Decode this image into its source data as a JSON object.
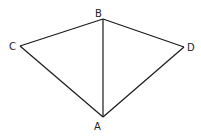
{
  "diagram": {
    "points": {
      "A": {
        "label": "A",
        "x": 103,
        "y": 117
      },
      "B": {
        "label": "B",
        "x": 103,
        "y": 19
      },
      "C": {
        "label": "C",
        "x": 20,
        "y": 46
      },
      "D": {
        "label": "D",
        "x": 184,
        "y": 47
      }
    },
    "edges": [
      [
        "C",
        "B"
      ],
      [
        "B",
        "D"
      ],
      [
        "D",
        "A"
      ],
      [
        "A",
        "C"
      ],
      [
        "B",
        "A"
      ]
    ]
  }
}
